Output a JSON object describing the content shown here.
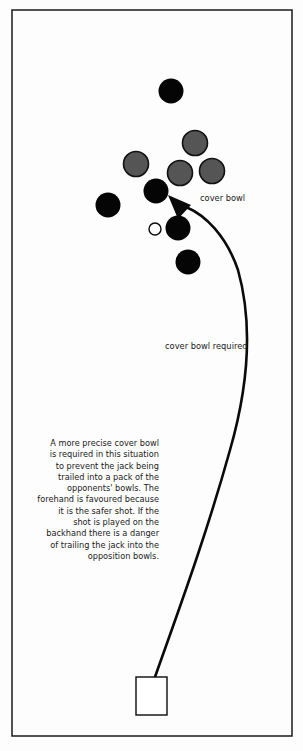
{
  "diagram": {
    "frame": {
      "x": 12,
      "y": 10,
      "width": 280,
      "height": 726
    },
    "colors": {
      "background": "#fdfdfd",
      "own_bowl": "#050505",
      "opponent_bowl": "#555555",
      "opponent_bowl_outline": "#111111",
      "jack": "#ffffff",
      "line": "#0a0a0a",
      "text": "#1a1a1a"
    },
    "bowls": [
      {
        "type": "own",
        "cx": 171,
        "cy": 91,
        "r": 12.5
      },
      {
        "type": "opponent",
        "cx": 195,
        "cy": 143,
        "r": 12.5
      },
      {
        "type": "opponent",
        "cx": 136,
        "cy": 164,
        "r": 12.5
      },
      {
        "type": "opponent",
        "cx": 180,
        "cy": 173,
        "r": 12.5
      },
      {
        "type": "opponent",
        "cx": 212,
        "cy": 171,
        "r": 12.5
      },
      {
        "type": "own",
        "cx": 156,
        "cy": 191,
        "r": 12.5
      },
      {
        "type": "own",
        "cx": 108,
        "cy": 205,
        "r": 12.5
      },
      {
        "type": "own",
        "cx": 178,
        "cy": 228,
        "r": 12.5
      },
      {
        "type": "own",
        "cx": 188,
        "cy": 262,
        "r": 12.5
      }
    ],
    "jack": {
      "cx": 155,
      "cy": 229,
      "r": 6
    },
    "mat": {
      "x": 136,
      "y": 677,
      "width": 31,
      "height": 38
    },
    "delivery_path": "M 155 677 C 175 620, 205 540, 230 450 C 250 380, 252 320, 238 270 C 226 235, 205 215, 186 207",
    "arrowhead": "168,195 191,205 178,219",
    "labels": {
      "cover_bowl": "cover bowl",
      "cover_bowl_required": "cover bowl required"
    },
    "explanation_lines": [
      "A more precise cover bowl",
      "is required in this situation",
      "to prevent the jack being",
      "trailed into a pack of the",
      "opponents' bowls. The",
      "forehand is favoured because",
      "it is the safer shot. If the",
      "shot is played on the",
      "backhand there is a danger",
      "of trailing the jack into the",
      "opposition bowls."
    ]
  }
}
